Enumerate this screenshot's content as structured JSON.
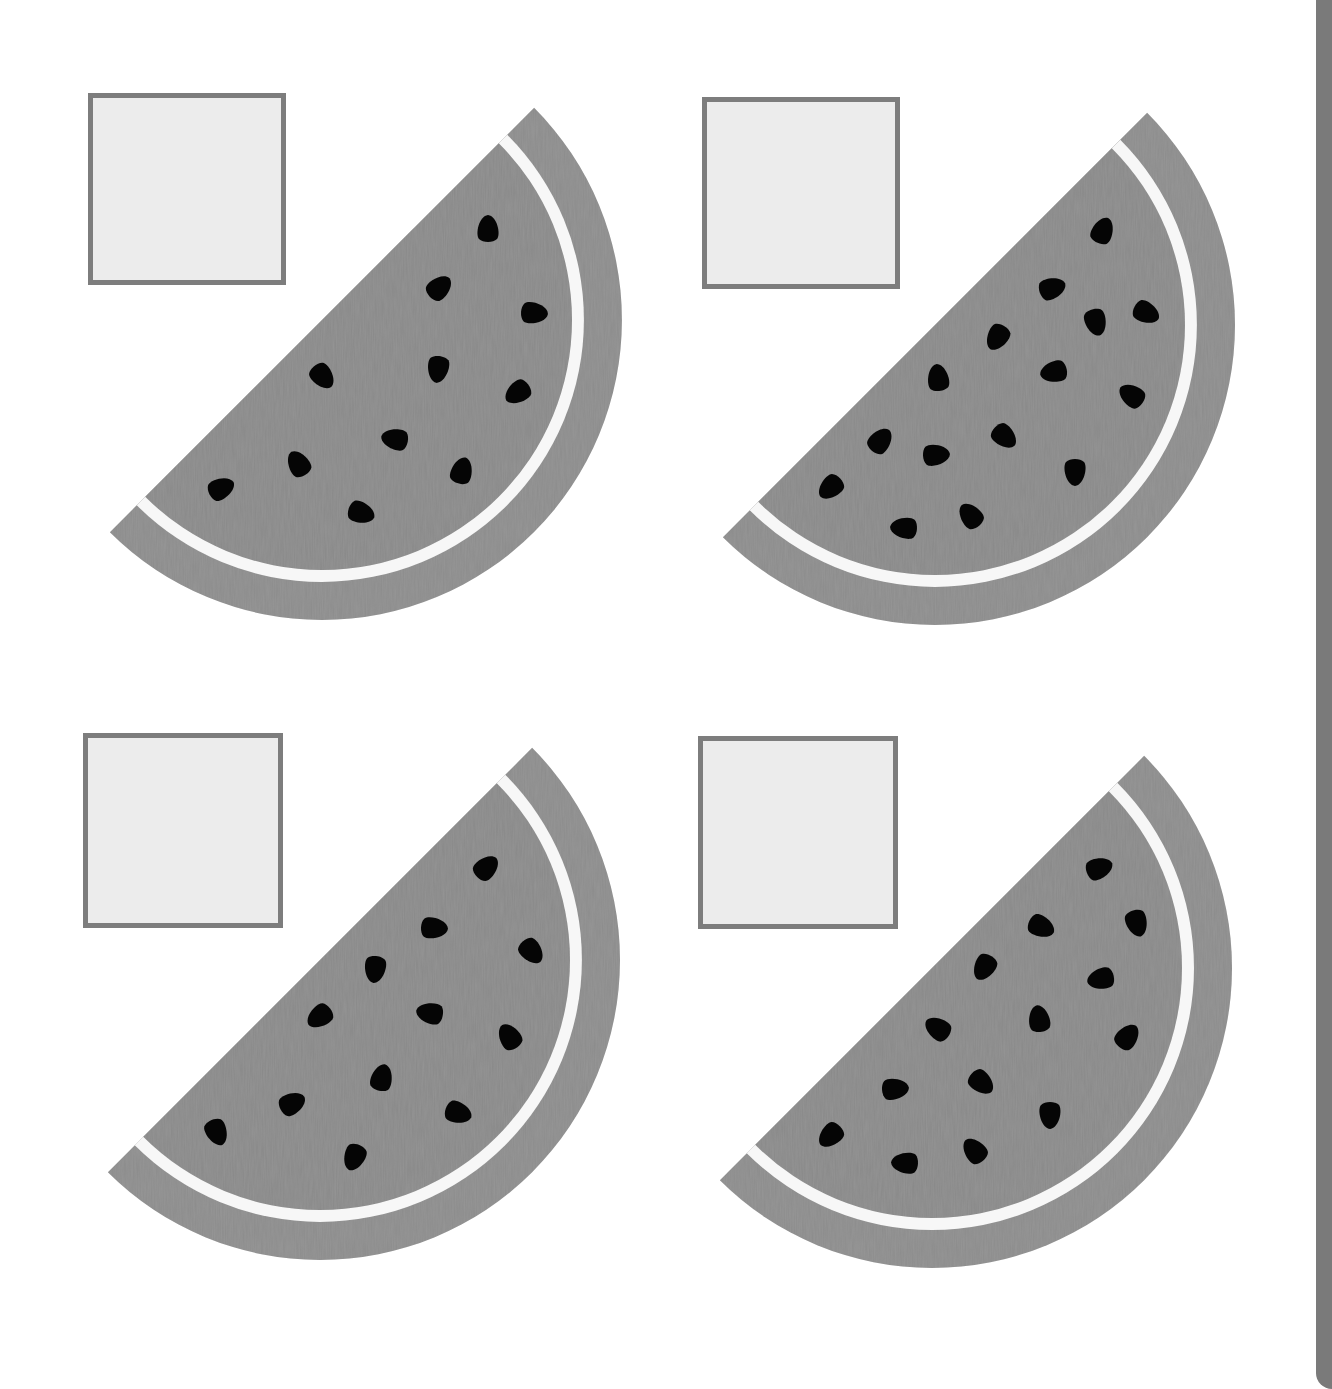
{
  "worksheet": {
    "task": "count-the-seeds",
    "colors": {
      "rind": "#8c8c8c",
      "white_band": "#f7f7f7",
      "flesh": "#898989",
      "seed": "#050505",
      "box_border": "#7d7d7d",
      "box_fill": "#ececec",
      "edge_strip": "#7a7a7a"
    },
    "slices": [
      {
        "id": 1,
        "seed_count": 11,
        "answer_box": {
          "x": 88,
          "y": 93,
          "w": 198,
          "h": 192,
          "value": ""
        },
        "center": [
          322,
          320
        ],
        "seeds": [
          [
            488,
            228
          ],
          [
            440,
            287
          ],
          [
            535,
            313
          ],
          [
            323,
            377
          ],
          [
            438,
            370
          ],
          [
            517,
            393
          ],
          [
            394,
            439
          ],
          [
            298,
            463
          ],
          [
            462,
            470
          ],
          [
            222,
            488
          ],
          [
            362,
            513
          ]
        ]
      },
      {
        "id": 2,
        "seed_count": 15,
        "answer_box": {
          "x": 702,
          "y": 97,
          "w": 198,
          "h": 192,
          "value": ""
        },
        "center": [
          935,
          325
        ],
        "seeds": [
          [
            1103,
            230
          ],
          [
            1053,
            288
          ],
          [
            1147,
            313
          ],
          [
            1096,
            323
          ],
          [
            997,
            338
          ],
          [
            1053,
            372
          ],
          [
            1131,
            395
          ],
          [
            938,
            377
          ],
          [
            881,
            440
          ],
          [
            937,
            455
          ],
          [
            1005,
            437
          ],
          [
            1075,
            473
          ],
          [
            830,
            488
          ],
          [
            903,
            528
          ],
          [
            970,
            515
          ]
        ]
      },
      {
        "id": 3,
        "seed_count": 12,
        "answer_box": {
          "x": 83,
          "y": 733,
          "w": 200,
          "h": 195,
          "value": ""
        },
        "center": [
          320,
          960
        ],
        "seeds": [
          [
            487,
            867
          ],
          [
            435,
            928
          ],
          [
            532,
            952
          ],
          [
            375,
            970
          ],
          [
            319,
            1017
          ],
          [
            429,
            1013
          ],
          [
            509,
            1036
          ],
          [
            382,
            1077
          ],
          [
            293,
            1103
          ],
          [
            459,
            1113
          ],
          [
            217,
            1133
          ],
          [
            354,
            1158
          ]
        ]
      },
      {
        "id": 4,
        "seed_count": 14,
        "answer_box": {
          "x": 698,
          "y": 736,
          "w": 200,
          "h": 193,
          "value": ""
        },
        "center": [
          932,
          968
        ],
        "seeds": [
          [
            1100,
            868
          ],
          [
            1042,
            927
          ],
          [
            1137,
            924
          ],
          [
            984,
            968
          ],
          [
            1100,
            979
          ],
          [
            937,
            1028
          ],
          [
            1039,
            1018
          ],
          [
            1128,
            1036
          ],
          [
            896,
            1089
          ],
          [
            982,
            1083
          ],
          [
            1050,
            1116
          ],
          [
            830,
            1136
          ],
          [
            904,
            1163
          ],
          [
            974,
            1150
          ]
        ]
      }
    ]
  }
}
